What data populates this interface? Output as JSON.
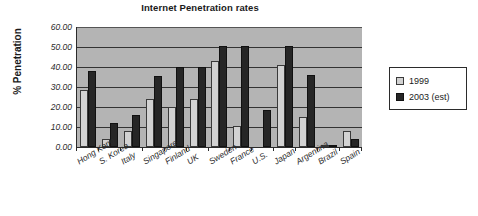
{
  "chart_data": {
    "type": "bar",
    "title": "Internet Penetration rates",
    "xlabel": "",
    "ylabel": "% Penetration",
    "ylim": [
      0,
      60
    ],
    "yticks": [
      "0.00",
      "10.00",
      "20.00",
      "30.00",
      "40.00",
      "50.00",
      "60.00"
    ],
    "grid": true,
    "legend_position": "right",
    "categories": [
      "Hong Kong",
      "S. Korea",
      "Italy",
      "Singapore",
      "Finland",
      "UK",
      "Sweden",
      "France",
      "U.S.",
      "Japan",
      "Argentina",
      "Brazil",
      "Spain"
    ],
    "series": [
      {
        "name": "1999",
        "color": "#d2d2d2",
        "values": [
          28.5,
          4.0,
          8.0,
          24.0,
          20.0,
          24.0,
          43.0,
          10.5,
          0.0,
          41.0,
          15.0,
          0.5,
          8.0
        ]
      },
      {
        "name": "2003 (est)",
        "color": "#262626",
        "values": [
          38.0,
          12.0,
          16.0,
          35.5,
          40.0,
          40.0,
          50.5,
          50.5,
          18.5,
          50.5,
          36.0,
          1.0,
          4.0
        ]
      }
    ]
  },
  "legend": {
    "entries": [
      {
        "label": "1999"
      },
      {
        "label": "2003 (est)"
      }
    ]
  }
}
